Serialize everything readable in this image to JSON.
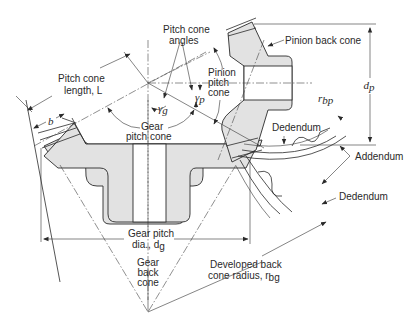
{
  "diagram": {
    "labels": {
      "pitch_cone_angles_1": "Pitch cone",
      "pitch_cone_angles_2": "angles",
      "pitch_cone_length_1": "Pitch cone",
      "pitch_cone_length_2": "length, ",
      "pitch_cone_length_sym": "L",
      "face_width_sym": "b",
      "gamma_g": "γ",
      "gamma_g_sub": "g",
      "gamma_p": "γ",
      "gamma_p_sub": "p",
      "gear_pitch_cone_1": "Gear",
      "gear_pitch_cone_2": "pitch cone",
      "pinion_pitch_cone_1": "Pinion",
      "pinion_pitch_cone_2": "pitch",
      "pinion_pitch_cone_3": "cone",
      "pinion_back_cone": "Pinion back cone",
      "pinion_pitch_dia_sym": "d",
      "pinion_pitch_dia_sub": "p",
      "r_bp_sym": "r",
      "r_bp_sub": "bp",
      "dedendum_top": "Dedendum",
      "addendum": "Addendum",
      "dedendum_bottom": "Dedendum",
      "gear_pitch_dia_1": "Gear pitch",
      "gear_pitch_dia_2": "dia., ",
      "gear_pitch_dia_sym": "d",
      "gear_pitch_dia_sub": "g",
      "gear_back_cone_1": "Gear",
      "gear_back_cone_2": "back",
      "gear_back_cone_3": "cone",
      "developed_back_cone_1": "Developed back",
      "developed_back_cone_2": "cone radius, ",
      "developed_back_cone_sym": "r",
      "developed_back_cone_sub": "bg"
    },
    "colors": {
      "line": "#2a2a2a",
      "section_fill": "#e2e2e2",
      "background": "#ffffff"
    }
  }
}
